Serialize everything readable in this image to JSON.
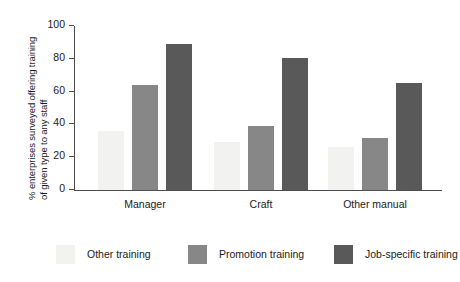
{
  "chart_data": {
    "type": "bar",
    "title": "",
    "xlabel": "",
    "ylabel_line1": "% enterprises surveyed offering training",
    "ylabel_line2": "of given type to any staff",
    "categories": [
      "Manager",
      "Craft",
      "Other manual"
    ],
    "series": [
      {
        "name": "Other training",
        "color": "#f2f2f0",
        "values": [
          36,
          29,
          26
        ]
      },
      {
        "name": "Promotion training",
        "color": "#878787",
        "values": [
          64,
          39,
          32
        ]
      },
      {
        "name": "Job-specific training",
        "color": "#595959",
        "values": [
          89,
          80.5,
          65
        ]
      }
    ],
    "ylim": [
      0,
      100
    ],
    "yticks": [
      0,
      20,
      40,
      60,
      80,
      100
    ],
    "ytick_labels": [
      "0",
      "20",
      "40",
      "60",
      "80",
      "100"
    ],
    "grid": false,
    "legend_position": "bottom",
    "axis_color": "#4d4d4d",
    "background": "#ffffff"
  }
}
